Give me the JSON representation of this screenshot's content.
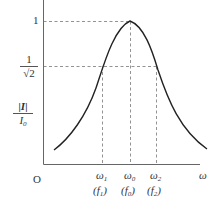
{
  "diagram": {
    "type": "resonance-curve",
    "y_axis_label": {
      "numerator": "|I|",
      "denominator": "I",
      "denominator_sub": "0"
    },
    "x_axis_label": "ω",
    "origin_label": "O",
    "y_ticks": [
      {
        "label": "1"
      },
      {
        "numerator": "1",
        "denominator": "√2"
      }
    ],
    "x_ticks": [
      {
        "omega": "ω",
        "omega_sub": "1",
        "freq": "(f",
        "freq_sub": "1",
        "close": ")"
      },
      {
        "omega": "ω",
        "omega_sub": "0",
        "freq": "(f",
        "freq_sub": "0",
        "close": ")"
      },
      {
        "omega": "ω",
        "omega_sub": "2",
        "freq": "(f",
        "freq_sub": "2",
        "close": ")"
      }
    ],
    "colors": {
      "curve": "#222222",
      "axis": "#666666",
      "dashed": "#777777"
    }
  }
}
